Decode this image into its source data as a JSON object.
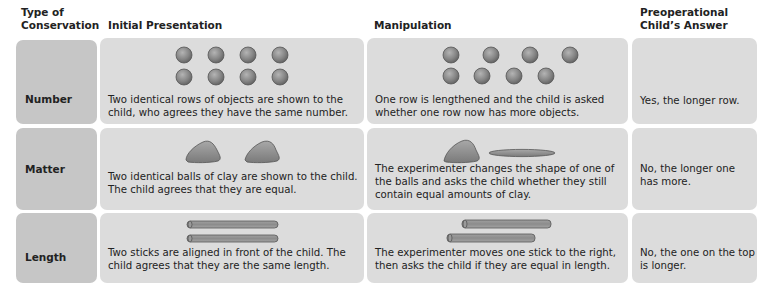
{
  "table": {
    "headers": [
      {
        "id": "type",
        "label": "Type of\nConservation",
        "lines": [
          "Type of",
          "Conservation"
        ]
      },
      {
        "id": "initial",
        "label": "Initial Presentation",
        "lines": [
          "Initial Presentation"
        ]
      },
      {
        "id": "manipulation",
        "label": "Manipulation",
        "lines": [
          "Manipulation"
        ]
      },
      {
        "id": "answer",
        "label": "Preoperational\nChild’s Answer",
        "lines": [
          "Preoperational",
          "Child’s Answer"
        ]
      }
    ],
    "rows": [
      {
        "type": "Number",
        "initial": {
          "figure": "two-equal-rows-of-balls-icon",
          "text": "Two identical rows of objects are shown to the child, who agrees they have the same number."
        },
        "manipulation": {
          "figure": "lengthened-row-of-balls-icon",
          "text": "One row is lengthened and the child is asked whether one row now has more objects."
        },
        "answer": "Yes, the longer row."
      },
      {
        "type": "Matter",
        "initial": {
          "figure": "two-clay-balls-icon",
          "text": "Two identical balls of clay are shown to the child. The child agrees that they are equal."
        },
        "manipulation": {
          "figure": "clay-ball-and-flattened-clay-icon",
          "text": "The experimenter changes the shape of one of the balls and asks the child whether they still contain equal amounts of clay."
        },
        "answer": "No, the longer one has more."
      },
      {
        "type": "Length",
        "initial": {
          "figure": "two-aligned-sticks-icon",
          "text": "Two sticks are aligned in front of the child. The child agrees that they are the same length."
        },
        "manipulation": {
          "figure": "offset-sticks-icon",
          "text": "The experimenter moves one stick to the right, then asks the child if they are equal in length."
        },
        "answer": "No, the one on the top is longer."
      }
    ]
  },
  "colors": {
    "type_cell": "#c6c6c6",
    "content_cell": "#dcdcdc",
    "object_fill": "#8a8a8a",
    "text": "#222222"
  }
}
